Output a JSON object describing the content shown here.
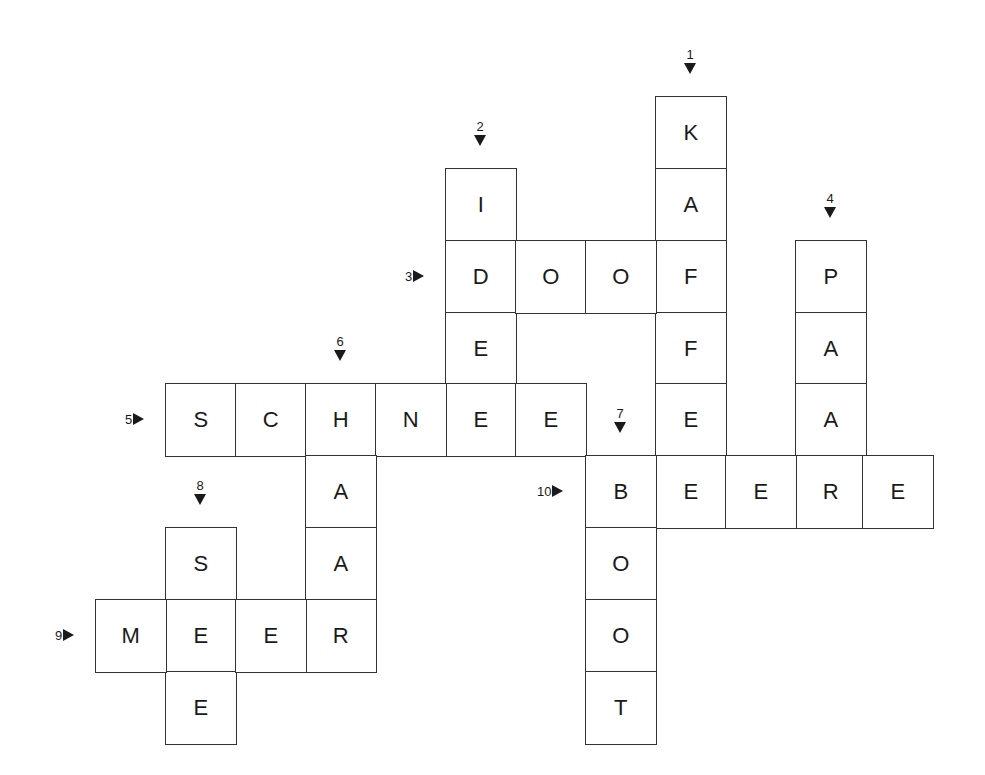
{
  "puzzle": {
    "type": "crossword",
    "grid": {
      "col_x": [
        95,
        165,
        235,
        305,
        375,
        445,
        515,
        585,
        655,
        725,
        795,
        862
      ],
      "row_y": [
        96,
        168,
        240,
        312,
        383,
        455,
        527,
        599,
        671
      ],
      "cell_w": 70,
      "cell_h": 72
    },
    "words": [
      {
        "number": "1",
        "direction": "down",
        "answer": "KAFFEE",
        "col": 8,
        "row": 0
      },
      {
        "number": "2",
        "direction": "down",
        "answer": "IDEE",
        "col": 5,
        "row": 1
      },
      {
        "number": "3",
        "direction": "across",
        "answer": "DOOF",
        "col": 5,
        "row": 2
      },
      {
        "number": "4",
        "direction": "down",
        "answer": "PAAR",
        "col": 10,
        "row": 2
      },
      {
        "number": "5",
        "direction": "across",
        "answer": "SCHNEE",
        "col": 1,
        "row": 4
      },
      {
        "number": "6",
        "direction": "down",
        "answer": "HAAR",
        "col": 3,
        "row": 4
      },
      {
        "number": "7",
        "direction": "down",
        "answer": "BOOT",
        "col": 7,
        "row": 5
      },
      {
        "number": "8",
        "direction": "down",
        "answer": "SEE",
        "col": 1,
        "row": 6
      },
      {
        "number": "9",
        "direction": "across",
        "answer": "MEER",
        "col": 0,
        "row": 7
      },
      {
        "number": "10",
        "direction": "across",
        "answer": "BEERE",
        "col": 7,
        "row": 5
      }
    ]
  }
}
